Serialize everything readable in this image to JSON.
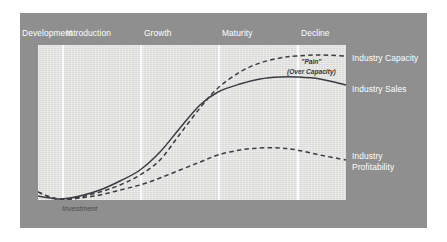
{
  "figure": {
    "background_color": "#ffffff",
    "card_color": "#8e8f8e",
    "plot_color": "#e1e1e0",
    "divider_color": "#fdfdfd",
    "label_color": "#ffffff",
    "curve_color": "#3c3c42"
  },
  "stages": [
    {
      "label": "Development",
      "x": 22
    },
    {
      "label": "Introduction",
      "x": 66
    },
    {
      "label": "Growth",
      "x": 144
    },
    {
      "label": "Maturity",
      "x": 222
    },
    {
      "label": "Decline",
      "x": 301
    }
  ],
  "dividers": [
    62,
    140,
    218,
    297
  ],
  "series_labels": [
    {
      "name": "industry-capacity",
      "text": "Industry Capacity",
      "x": 352,
      "y": 53
    },
    {
      "name": "industry-sales",
      "text": "Industry Sales",
      "x": 352,
      "y": 84
    },
    {
      "name": "industry-profitability-line1",
      "text": "Industry",
      "x": 352,
      "y": 151
    },
    {
      "name": "industry-profitability-line2",
      "text": "Profitability",
      "x": 352,
      "y": 160
    }
  ],
  "annotations": {
    "pain": {
      "line1": "\"Pain\"",
      "line2": "(Over Capacity)",
      "x": 299,
      "y": 59
    },
    "investment": {
      "text": "Investment",
      "x": 62,
      "y": 206
    }
  },
  "chart_data": {
    "type": "line",
    "xlabel": "",
    "ylabel": "",
    "grid": false,
    "legend_position": "right",
    "x_categories": [
      "Development",
      "Introduction",
      "Growth",
      "Maturity",
      "Decline"
    ],
    "x_boundaries_px": [
      38,
      62,
      140,
      218,
      297,
      346
    ],
    "series": [
      {
        "name": "Industry Capacity",
        "style": "dashed",
        "color": "#3c3c42",
        "points": [
          [
            38,
            192
          ],
          [
            50,
            197
          ],
          [
            62,
            199
          ],
          [
            80,
            197
          ],
          [
            100,
            192
          ],
          [
            120,
            185
          ],
          [
            140,
            175
          ],
          [
            160,
            160
          ],
          [
            180,
            134
          ],
          [
            200,
            108
          ],
          [
            218,
            88
          ],
          [
            240,
            72
          ],
          [
            260,
            63
          ],
          [
            280,
            58
          ],
          [
            297,
            56
          ],
          [
            320,
            55
          ],
          [
            346,
            56
          ]
        ]
      },
      {
        "name": "Industry Sales",
        "style": "solid",
        "color": "#3c3c42",
        "points": [
          [
            38,
            196
          ],
          [
            50,
            198
          ],
          [
            62,
            199
          ],
          [
            80,
            196
          ],
          [
            100,
            190
          ],
          [
            120,
            181
          ],
          [
            140,
            170
          ],
          [
            160,
            152
          ],
          [
            180,
            128
          ],
          [
            200,
            105
          ],
          [
            218,
            92
          ],
          [
            240,
            84
          ],
          [
            260,
            79
          ],
          [
            280,
            77
          ],
          [
            297,
            77
          ],
          [
            320,
            79
          ],
          [
            346,
            85
          ]
        ]
      },
      {
        "name": "Industry Profitability",
        "style": "dashed",
        "color": "#3c3c42",
        "points": [
          [
            38,
            192
          ],
          [
            50,
            197
          ],
          [
            62,
            200
          ],
          [
            80,
            198
          ],
          [
            100,
            195
          ],
          [
            120,
            190
          ],
          [
            140,
            185
          ],
          [
            160,
            178
          ],
          [
            180,
            170
          ],
          [
            200,
            162
          ],
          [
            218,
            155
          ],
          [
            240,
            150
          ],
          [
            260,
            148
          ],
          [
            280,
            148
          ],
          [
            297,
            150
          ],
          [
            320,
            155
          ],
          [
            346,
            160
          ]
        ]
      }
    ]
  }
}
